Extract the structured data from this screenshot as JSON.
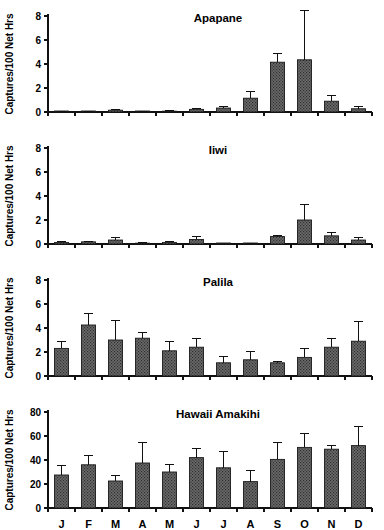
{
  "figure": {
    "background": "#ffffff",
    "bar_fill": "#595959",
    "bar_edge": "#1a1a1a",
    "axis_color": "#111111"
  },
  "chart_data": [
    {
      "type": "bar",
      "title": "Apapane",
      "xlabel": "",
      "ylabel": "Captures/100 Net Hrs",
      "categories": [
        "J",
        "F",
        "M",
        "A",
        "M",
        "J",
        "J",
        "A",
        "S",
        "O",
        "N",
        "D"
      ],
      "values": [
        0.02,
        0.02,
        0.15,
        0.03,
        0.07,
        0.22,
        0.33,
        1.15,
        4.15,
        4.35,
        0.9,
        0.27
      ],
      "errors": [
        0.02,
        0.03,
        0.07,
        0.02,
        0.04,
        0.1,
        0.13,
        0.6,
        0.7,
        4.1,
        0.5,
        0.15
      ],
      "ylim": [
        0,
        8
      ],
      "yticks": [
        0,
        2,
        4,
        6,
        8
      ],
      "grid": false,
      "legend": "none"
    },
    {
      "type": "bar",
      "title": "Iiwi",
      "xlabel": "",
      "ylabel": "Captures/100 Net Hrs",
      "categories": [
        "J",
        "F",
        "M",
        "A",
        "M",
        "J",
        "J",
        "A",
        "S",
        "O",
        "N",
        "D"
      ],
      "values": [
        0.13,
        0.18,
        0.33,
        0.07,
        0.13,
        0.38,
        0.0,
        0.02,
        0.62,
        2.0,
        0.68,
        0.33
      ],
      "errors": [
        0.06,
        0.07,
        0.18,
        0.04,
        0.07,
        0.27,
        0.0,
        0.02,
        0.1,
        1.3,
        0.3,
        0.18
      ],
      "ylim": [
        0,
        8
      ],
      "yticks": [
        0,
        2,
        4,
        6,
        8
      ],
      "grid": false,
      "legend": "none"
    },
    {
      "type": "bar",
      "title": "Palila",
      "xlabel": "",
      "ylabel": "Captures/100 Net Hrs",
      "categories": [
        "J",
        "F",
        "M",
        "A",
        "M",
        "J",
        "J",
        "A",
        "S",
        "O",
        "N",
        "D"
      ],
      "values": [
        2.3,
        4.25,
        3.0,
        3.15,
        2.1,
        2.4,
        1.1,
        1.35,
        1.1,
        1.55,
        2.4,
        2.9
      ],
      "errors": [
        0.6,
        1.0,
        1.65,
        0.45,
        0.8,
        0.75,
        0.5,
        0.7,
        0.1,
        0.75,
        0.7,
        1.65
      ],
      "ylim": [
        0,
        8
      ],
      "yticks": [
        0,
        2,
        4,
        6,
        8
      ],
      "grid": false,
      "legend": "none"
    },
    {
      "type": "bar",
      "title": "Hawaii Amakihi",
      "xlabel": "",
      "ylabel": "Captures/100 Net Hrs",
      "categories": [
        "J",
        "F",
        "M",
        "A",
        "M",
        "J",
        "J",
        "A",
        "S",
        "O",
        "N",
        "D"
      ],
      "values": [
        27.5,
        36.0,
        22.5,
        37.5,
        30.0,
        42.0,
        33.5,
        22.0,
        40.5,
        50.5,
        49.0,
        52.0
      ],
      "errors": [
        8.0,
        7.5,
        4.5,
        17.0,
        6.0,
        7.5,
        13.5,
        9.5,
        14.0,
        11.5,
        3.0,
        16.0
      ],
      "ylim": [
        0,
        80
      ],
      "yticks": [
        0,
        20,
        40,
        60,
        80
      ],
      "grid": false,
      "legend": "none"
    }
  ]
}
